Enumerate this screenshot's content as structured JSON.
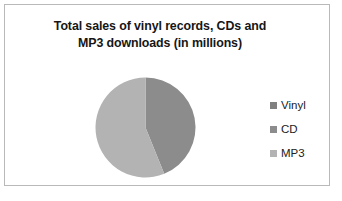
{
  "chart_data": {
    "type": "pie",
    "title": "Total sales of vinyl records, CDs and MP3 downloads (in millions)",
    "title_lines": [
      "Total sales of vinyl records, CDs and",
      "MP3 downloads (in millions)"
    ],
    "categories": [
      "Vinyl",
      "CD",
      "MP3"
    ],
    "values": [
      0,
      44,
      56
    ],
    "value_unit": "percent of total",
    "slices": [
      {
        "label": "Vinyl",
        "value": 0,
        "percent": 0,
        "color": "#808080",
        "start_angle": 0,
        "end_angle": 0
      },
      {
        "label": "CD",
        "value": 44,
        "percent": 44,
        "color": "#8c8c8c",
        "start_angle": 0,
        "end_angle": 158
      },
      {
        "label": "MP3",
        "value": 56,
        "percent": 56,
        "color": "#b3b3b3",
        "start_angle": 158,
        "end_angle": 360
      }
    ],
    "legend": {
      "position": "right",
      "entries": [
        {
          "label": "Vinyl",
          "color": "#808080"
        },
        {
          "label": "CD",
          "color": "#8c8c8c"
        },
        {
          "label": "MP3",
          "color": "#b3b3b3"
        }
      ]
    },
    "xlabel": "",
    "ylabel": "",
    "grid": false,
    "data_labels": false,
    "geometry": {
      "center_x": 140,
      "center_y": 122,
      "radius": 50
    }
  },
  "frame": {
    "border_color": "#b9b9b9",
    "background": "#ffffff"
  }
}
